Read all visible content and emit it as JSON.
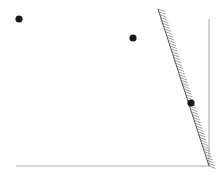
{
  "diagram": {
    "width": 223,
    "height": 178,
    "colors": {
      "background": "#ffffff",
      "point": "#1a1a1a",
      "axis": "#b0b0b0",
      "wall": "#555555",
      "hatch": "#8a8a8a"
    },
    "points": [
      {
        "id": "p1",
        "x": 19,
        "y": 19,
        "r": 3.6
      },
      {
        "id": "p2",
        "x": 133,
        "y": 38,
        "r": 3.6
      },
      {
        "id": "p3",
        "x": 191,
        "y": 103,
        "r": 3.6
      }
    ],
    "axes": {
      "bottom": {
        "x1": 16,
        "y1": 166,
        "x2": 209,
        "y2": 166
      },
      "right": {
        "x1": 209,
        "y1": 19,
        "x2": 209,
        "y2": 166
      }
    },
    "wall": {
      "x1": 158,
      "y1": 9,
      "x2": 209,
      "y2": 166,
      "hatch_side": "right",
      "hatch_spacing": 3,
      "hatch_length": 7
    }
  }
}
